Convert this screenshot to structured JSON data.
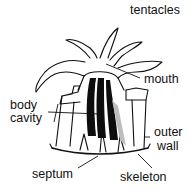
{
  "diagram": {
    "labels": {
      "tentacles": "tentacles",
      "mouth": "mouth",
      "body_line1": "body",
      "body_line2": "cavity",
      "outer_line1": "outer",
      "outer_line2": "wall",
      "septum": "septum",
      "skeleton": "skeleton"
    },
    "colors": {
      "ink": "#111111",
      "fill_dark": "#0d0d0d",
      "fill_grey": "#bdbdbd",
      "background": "#ffffff"
    }
  }
}
